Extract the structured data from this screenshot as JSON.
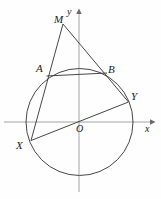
{
  "figure": {
    "stroke_color": "#3a3a3a",
    "axis_color": "#8a8a8a",
    "background": "#fefefe"
  },
  "axes": {
    "x_label": "x",
    "y_label": "y",
    "origin_label": "O",
    "x_axis_y": 122,
    "y_axis_x": 79,
    "x_axis_start": 4,
    "x_axis_end": 152,
    "y_axis_top": 10,
    "y_axis_bottom": 192
  },
  "circle": {
    "center_x": 79.5,
    "center_y": 122,
    "radius": 53.5
  },
  "points": [
    {
      "name": "M",
      "label": "M",
      "x": 63,
      "y": 24
    },
    {
      "name": "A",
      "label": "A",
      "x": 47.5,
      "y": 74
    },
    {
      "name": "B",
      "label": "B",
      "x": 106,
      "y": 73.5
    },
    {
      "name": "Y",
      "label": "Y",
      "x": 128.5,
      "y": 102
    },
    {
      "name": "X",
      "label": "X",
      "x": 31,
      "y": 140.5
    },
    {
      "name": "O",
      "label": "O",
      "x": 79.5,
      "y": 122
    }
  ],
  "segments": [
    {
      "name": "segment-M-X",
      "from": "M",
      "to": "X"
    },
    {
      "name": "segment-M-Y",
      "from": "M",
      "to": "Y"
    },
    {
      "name": "chord-A-B",
      "from": "A",
      "to": "B"
    },
    {
      "name": "chord-X-Y",
      "from": "X",
      "to": "Y"
    }
  ]
}
